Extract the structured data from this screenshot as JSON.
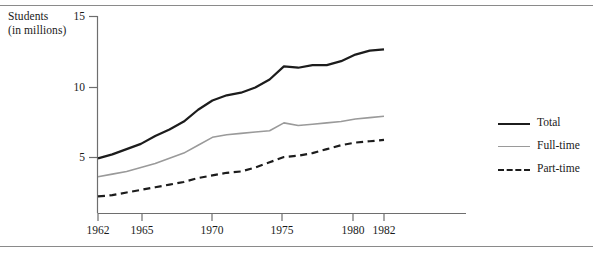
{
  "axis_title": "Students\n(in millions)",
  "legend": {
    "items": [
      {
        "label": "Total",
        "style": "solid-thick-black",
        "color": "#1c1c1c"
      },
      {
        "label": "Full-time",
        "style": "solid-gray",
        "color": "#9a9a9a"
      },
      {
        "label": "Part-time",
        "style": "dashed-black",
        "color": "#1c1c1c"
      }
    ]
  },
  "ticks": {
    "y": [
      "5",
      "10",
      "15"
    ],
    "x": [
      "1962",
      "1965",
      "1970",
      "1975",
      "1980",
      "1982"
    ]
  },
  "chart_data": {
    "type": "line",
    "title": "",
    "subtitle": "",
    "xlabel": "",
    "ylabel": "Students (in millions)",
    "xlim": [
      1962,
      1982
    ],
    "ylim": [
      0,
      15
    ],
    "yticks": [
      5,
      10,
      15
    ],
    "xticks": [
      1962,
      1965,
      1970,
      1975,
      1980,
      1982
    ],
    "grid": false,
    "legend_position": "right",
    "x": [
      1962,
      1963,
      1964,
      1965,
      1966,
      1967,
      1968,
      1969,
      1970,
      1971,
      1972,
      1973,
      1974,
      1975,
      1976,
      1977,
      1978,
      1979,
      1980,
      1981,
      1982
    ],
    "series": [
      {
        "name": "Total",
        "color": "#1c1c1c",
        "style": "solid",
        "width": 2.2,
        "values": [
          4.2,
          4.5,
          4.9,
          5.3,
          5.9,
          6.4,
          7.0,
          7.9,
          8.6,
          9.0,
          9.2,
          9.6,
          10.2,
          11.2,
          11.1,
          11.3,
          11.3,
          11.6,
          12.1,
          12.4,
          12.5
        ]
      },
      {
        "name": "Full-time",
        "color": "#9a9a9a",
        "style": "solid",
        "width": 1.6,
        "values": [
          2.8,
          3.0,
          3.2,
          3.5,
          3.8,
          4.2,
          4.6,
          5.2,
          5.8,
          6.0,
          6.1,
          6.2,
          6.3,
          6.9,
          6.7,
          6.8,
          6.9,
          7.0,
          7.2,
          7.3,
          7.4
        ]
      },
      {
        "name": "Part-time",
        "color": "#1c1c1c",
        "style": "dashed",
        "width": 2.2,
        "values": [
          1.3,
          1.4,
          1.6,
          1.8,
          2.0,
          2.2,
          2.4,
          2.7,
          2.9,
          3.1,
          3.2,
          3.5,
          3.9,
          4.3,
          4.4,
          4.6,
          4.9,
          5.2,
          5.4,
          5.5,
          5.6
        ]
      }
    ]
  }
}
